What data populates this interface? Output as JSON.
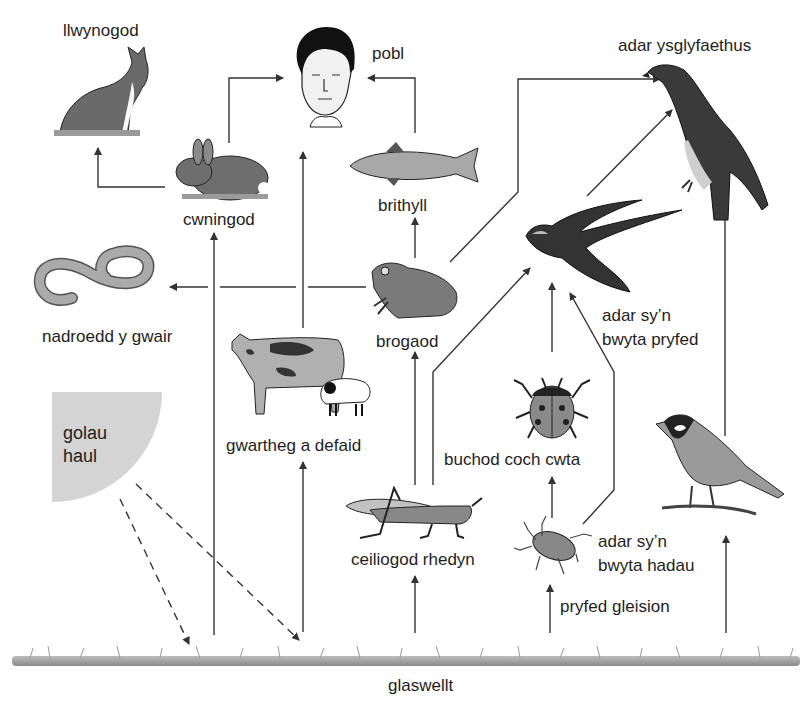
{
  "diagram": {
    "type": "food-web",
    "language": "Welsh",
    "nodes": {
      "foxes": {
        "label": "llwynogod",
        "icon": "fox-icon"
      },
      "people": {
        "label": "pobl",
        "icon": "human-face-icon"
      },
      "birds_of_prey": {
        "label": "adar ysglyfaethus",
        "icon": "eagle-icon"
      },
      "rabbits": {
        "label": "cwningod",
        "icon": "rabbit-icon"
      },
      "trout": {
        "label": "brithyll",
        "icon": "fish-icon"
      },
      "grass_snakes": {
        "label": "nadroedd y gwair",
        "icon": "snake-icon"
      },
      "frogs": {
        "label": "brogaod",
        "icon": "frog-icon"
      },
      "insect_eating_birds": {
        "label_line1": "adar sy’n",
        "label_line2": "bwyta pryfed",
        "icon": "swallow-icon"
      },
      "cattle_sheep": {
        "label": "gwartheg a defaid",
        "icon": "cow-sheep-icon"
      },
      "ladybirds": {
        "label": "buchod coch cwta",
        "icon": "ladybird-icon"
      },
      "grasshoppers": {
        "label": "ceiliogod rhedyn",
        "icon": "grasshopper-icon"
      },
      "aphids": {
        "label": "pryfed gleision",
        "icon": "aphid-icon"
      },
      "seed_eating_birds": {
        "label_line1": "adar sy’n",
        "label_line2": "bwyta hadau",
        "icon": "tit-bird-icon"
      },
      "sunlight": {
        "label_line1": "golau",
        "label_line2": "haul",
        "icon": "sun-quadrant-icon"
      },
      "grass": {
        "label": "glaswellt",
        "icon": "grass-strip-icon"
      }
    },
    "edges": [
      {
        "from": "rabbits",
        "to": "foxes"
      },
      {
        "from": "rabbits",
        "to": "people"
      },
      {
        "from": "trout",
        "to": "people"
      },
      {
        "from": "cattle_sheep",
        "to": "people"
      },
      {
        "from": "frogs",
        "to": "trout"
      },
      {
        "from": "frogs",
        "to": "grass_snakes"
      },
      {
        "from": "frogs",
        "to": "birds_of_prey"
      },
      {
        "from": "insect_eating_birds",
        "to": "birds_of_prey"
      },
      {
        "from": "seed_eating_birds",
        "to": "birds_of_prey"
      },
      {
        "from": "grasshoppers",
        "to": "frogs"
      },
      {
        "from": "grasshoppers",
        "to": "insect_eating_birds"
      },
      {
        "from": "ladybirds",
        "to": "insect_eating_birds"
      },
      {
        "from": "aphids",
        "to": "insect_eating_birds"
      },
      {
        "from": "aphids",
        "to": "ladybirds"
      },
      {
        "from": "grass",
        "to": "rabbits"
      },
      {
        "from": "grass",
        "to": "cattle_sheep"
      },
      {
        "from": "grass",
        "to": "grasshoppers"
      },
      {
        "from": "grass",
        "to": "aphids"
      },
      {
        "from": "grass",
        "to": "seed_eating_birds"
      },
      {
        "from": "sunlight",
        "to": "grass",
        "style": "dashed",
        "count": 2
      }
    ],
    "colors": {
      "line": "#333333",
      "sun_fill": "#d4d4d4",
      "grass": "#8a8a8a",
      "animal_mid": "#808080",
      "animal_dark": "#3a3a3a"
    }
  }
}
